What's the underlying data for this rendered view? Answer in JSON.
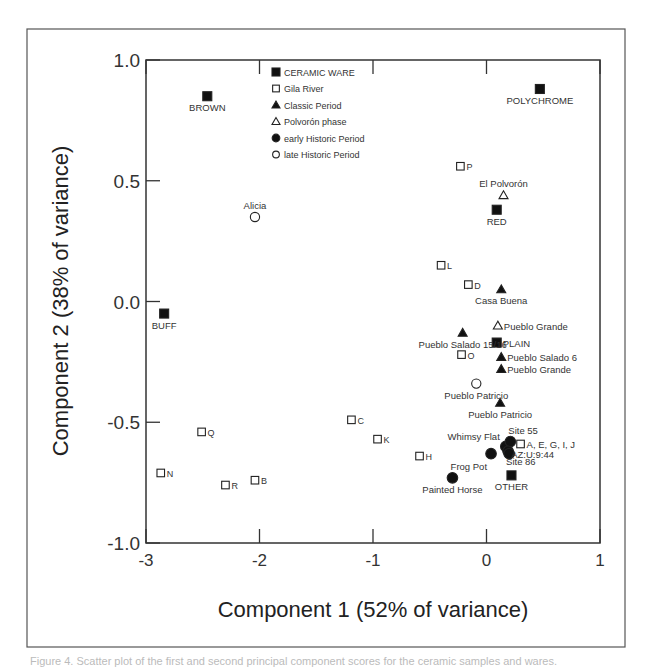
{
  "chart_data": {
    "type": "scatter",
    "title": "",
    "xlabel": "Component 1 (52% of variance)",
    "ylabel": "Component 2 (38% of variance)",
    "xlim": [
      -3,
      1
    ],
    "ylim": [
      -1.0,
      1.0
    ],
    "xticks": [
      "-3",
      "-2",
      "-1",
      "0",
      "1"
    ],
    "yticks": [
      "-1.0",
      "-0.5",
      "0.0",
      "0.5",
      "1.0"
    ],
    "grid": false,
    "legend_position": "upper-left-inside",
    "legend": [
      {
        "name": "CERAMIC WARE",
        "marker": "filled-square"
      },
      {
        "name": "Gila River",
        "marker": "open-square"
      },
      {
        "name": "Classic Period",
        "marker": "filled-triangle"
      },
      {
        "name": "Polvorón phase",
        "marker": "open-triangle"
      },
      {
        "name": "early Historic Period",
        "marker": "filled-circle"
      },
      {
        "name": "late Historic Period",
        "marker": "open-circle"
      }
    ],
    "series": [
      {
        "name": "CERAMIC WARE",
        "marker": "filled-square",
        "points": [
          {
            "label": "BROWN",
            "x": -2.46,
            "y": 0.85,
            "lpos": "below"
          },
          {
            "label": "POLYCHROME",
            "x": 0.47,
            "y": 0.88,
            "lpos": "below"
          },
          {
            "label": "RED",
            "x": 0.09,
            "y": 0.38,
            "lpos": "below"
          },
          {
            "label": "BUFF",
            "x": -2.84,
            "y": -0.05,
            "lpos": "below"
          },
          {
            "label": "PLAIN",
            "x": 0.09,
            "y": -0.17,
            "lpos": "right"
          },
          {
            "label": "OTHER",
            "x": 0.22,
            "y": -0.72,
            "lpos": "below"
          }
        ]
      },
      {
        "name": "Gila River",
        "marker": "open-square",
        "points": [
          {
            "label": "P",
            "x": -0.23,
            "y": 0.56,
            "lpos": "right"
          },
          {
            "label": "L",
            "x": -0.4,
            "y": 0.15,
            "lpos": "right"
          },
          {
            "label": "D",
            "x": -0.16,
            "y": 0.07,
            "lpos": "right"
          },
          {
            "label": "O",
            "x": -0.22,
            "y": -0.22,
            "lpos": "right"
          },
          {
            "label": "C",
            "x": -1.19,
            "y": -0.49,
            "lpos": "right"
          },
          {
            "label": "K",
            "x": -0.96,
            "y": -0.57,
            "lpos": "right"
          },
          {
            "label": "Q",
            "x": -2.51,
            "y": -0.54,
            "lpos": "right"
          },
          {
            "label": "H",
            "x": -0.59,
            "y": -0.64,
            "lpos": "right"
          },
          {
            "label": "N",
            "x": -2.87,
            "y": -0.71,
            "lpos": "right"
          },
          {
            "label": "R",
            "x": -2.3,
            "y": -0.76,
            "lpos": "right"
          },
          {
            "label": "B",
            "x": -2.04,
            "y": -0.74,
            "lpos": "right"
          },
          {
            "label": "A, E, G, I, J",
            "x": 0.3,
            "y": -0.59,
            "lpos": "right"
          }
        ]
      },
      {
        "name": "Classic Period",
        "marker": "filled-triangle",
        "points": [
          {
            "label": "Casa Buena",
            "x": 0.13,
            "y": 0.05,
            "lpos": "below"
          },
          {
            "label": "Pueblo Salado 15/16",
            "x": -0.21,
            "y": -0.13,
            "lpos": "below"
          },
          {
            "label": "Pueblo Salado 6",
            "x": 0.13,
            "y": -0.23,
            "lpos": "right"
          },
          {
            "label": "Pueblo Grande",
            "x": 0.13,
            "y": -0.28,
            "lpos": "right"
          },
          {
            "label": "Pueblo Patricio",
            "x": 0.12,
            "y": -0.42,
            "lpos": "below"
          }
        ]
      },
      {
        "name": "Polvorón phase",
        "marker": "open-triangle",
        "points": [
          {
            "label": "El Polvorón",
            "x": 0.15,
            "y": 0.44,
            "lpos": "above"
          },
          {
            "label": "Pueblo Grande",
            "x": 0.1,
            "y": -0.1,
            "lpos": "right"
          }
        ]
      },
      {
        "name": "early Historic Period",
        "marker": "filled-circle",
        "points": [
          {
            "label": "Whimsy Flat",
            "x": 0.17,
            "y": -0.6,
            "lpos": "aboveleft"
          },
          {
            "label": "Site 55",
            "x": 0.21,
            "y": -0.58,
            "lpos": "aboveright"
          },
          {
            "label": "Site 86",
            "x": 0.19,
            "y": -0.62,
            "lpos": "belowright"
          },
          {
            "label": "AZ:U:9:44",
            "x": 0.2,
            "y": -0.63,
            "lpos": "rightlow"
          },
          {
            "label": "Frog Pot",
            "x": 0.04,
            "y": -0.63,
            "lpos": "belowleft"
          },
          {
            "label": "Painted Horse",
            "x": -0.3,
            "y": -0.73,
            "lpos": "below"
          }
        ]
      },
      {
        "name": "late Historic Period",
        "marker": "open-circle",
        "points": [
          {
            "label": "Alicia",
            "x": -2.04,
            "y": 0.35,
            "lpos": "above"
          },
          {
            "label": "Pueblo Patricio",
            "x": -0.09,
            "y": -0.34,
            "lpos": "below"
          }
        ]
      }
    ]
  },
  "caption": "Figure 4. Scatter plot of the first and second principal component scores for the ceramic samples and wares."
}
